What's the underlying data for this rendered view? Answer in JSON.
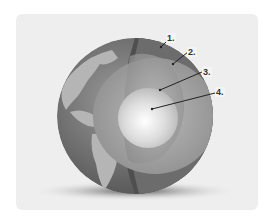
{
  "diagram": {
    "labels": [
      {
        "id": 1,
        "text": "1."
      },
      {
        "id": 2,
        "text": "2."
      },
      {
        "id": 3,
        "text": "3."
      },
      {
        "id": 4,
        "text": "4."
      }
    ]
  }
}
